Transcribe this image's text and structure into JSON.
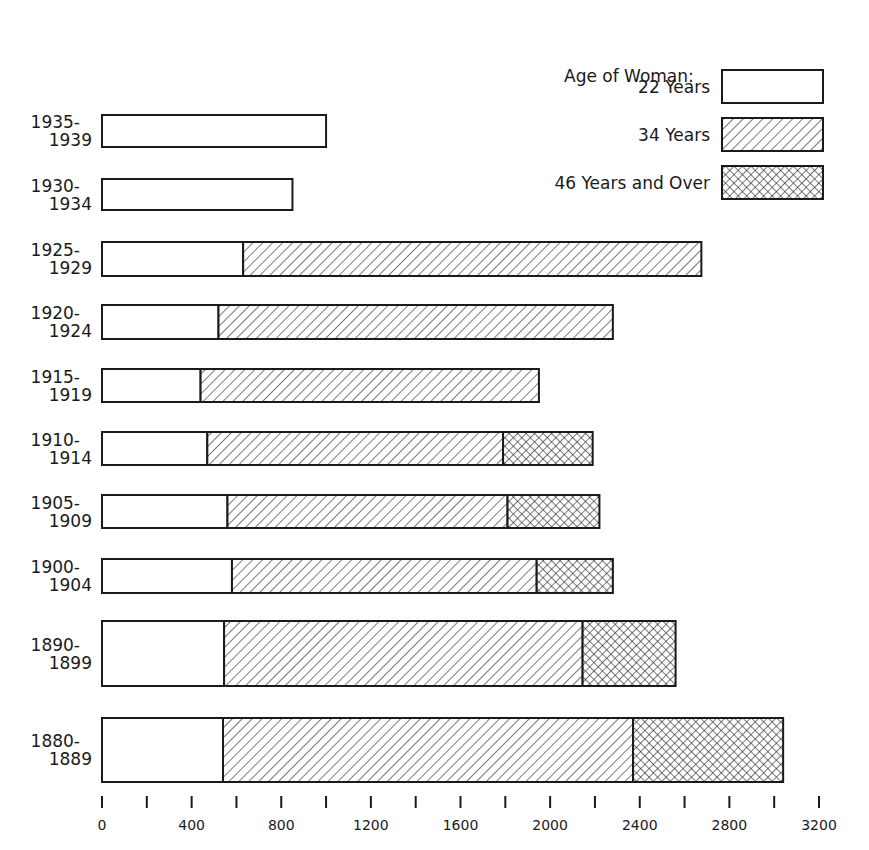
{
  "chart_data": {
    "type": "bar",
    "orientation": "horizontal",
    "stacked": true,
    "title": "",
    "xlabel": "",
    "ylabel": "",
    "xlim": [
      0,
      3200
    ],
    "x_ticks": [
      0,
      400,
      800,
      1200,
      1600,
      2000,
      2400,
      2800,
      3200
    ],
    "x_minor_ticks": [
      200,
      600,
      1000,
      1400,
      1800,
      2200,
      2600,
      3000
    ],
    "legend_title": "Age of Woman:",
    "legend_position": "top-right",
    "categories": [
      {
        "top": "1935-",
        "bottom": "1939"
      },
      {
        "top": "1930-",
        "bottom": "1934"
      },
      {
        "top": "1925-",
        "bottom": "1929"
      },
      {
        "top": "1920-",
        "bottom": "1924"
      },
      {
        "top": "1915-",
        "bottom": "1919"
      },
      {
        "top": "1910-",
        "bottom": "1914"
      },
      {
        "top": "1905-",
        "bottom": "1909"
      },
      {
        "top": "1900-",
        "bottom": "1904"
      },
      {
        "top": "1890-",
        "bottom": "1899"
      },
      {
        "top": "1880-",
        "bottom": "1889"
      }
    ],
    "series": [
      {
        "name": "22 Years",
        "pattern": "blank",
        "values": [
          1000,
          850,
          630,
          520,
          440,
          470,
          560,
          580,
          545,
          540
        ]
      },
      {
        "name": "34 Years",
        "pattern": "diagonal-hatch",
        "values": [
          0,
          0,
          2045,
          1760,
          1510,
          1320,
          1250,
          1360,
          1600,
          1830
        ]
      },
      {
        "name": "46 Years and Over",
        "pattern": "cross-hatch",
        "values": [
          0,
          0,
          0,
          0,
          0,
          400,
          410,
          340,
          415,
          670
        ]
      }
    ],
    "totals": [
      1000,
      850,
      2675,
      2280,
      1950,
      2190,
      2220,
      2280,
      2560,
      3040
    ]
  },
  "legend": {
    "title": "Age of Woman:",
    "items": [
      "22 Years",
      "34 Years",
      "46 Years and Over"
    ]
  }
}
